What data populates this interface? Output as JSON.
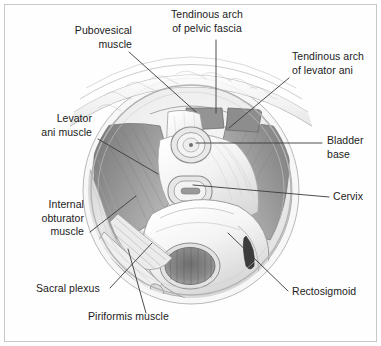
{
  "figure": {
    "type": "anatomical-illustration",
    "background_color": "#ffffff",
    "frame_color": "#c8c8c8",
    "label_color": "#1b1b1b",
    "leader_line_color": "#3a3a3a",
    "palette": {
      "muscle_dark": "#8c8c8c",
      "muscle_mid": "#aaaaaa",
      "muscle_light": "#cfcfcf",
      "organ_light": "#f1f1f1",
      "organ_shadow": "#d8d8d8",
      "outline": "#6e6e6e",
      "lumen_dark": "#5a5a5a"
    },
    "labels": [
      {
        "id": "pubovesical-muscle",
        "text": "Pubovesical\nmuscle",
        "align": "right",
        "x": 66,
        "y": 31,
        "leader": [
          [
            129,
            52
          ],
          [
            196,
            112
          ]
        ]
      },
      {
        "id": "tendinous-arch-of-pelvic-fascia",
        "text": "Tendinous arch\nof pelvic fascia",
        "align": "center",
        "x": 179,
        "y": 10,
        "leader": [
          [
            216,
            40
          ],
          [
            216,
            113
          ]
        ]
      },
      {
        "id": "tendinous-arch-of-levator-ani",
        "text": "Tendinous arch\nof levator ani",
        "align": "left",
        "x": 292,
        "y": 52,
        "leader": [
          [
            289,
            78
          ],
          [
            229,
            128
          ]
        ]
      },
      {
        "id": "levator-ani-muscle",
        "text": "Levator\nani muscle",
        "align": "right",
        "x": 22,
        "y": 118,
        "leader": [
          [
            98,
            139
          ],
          [
            158,
            174
          ]
        ]
      },
      {
        "id": "bladder-base",
        "text": "Bladder\nbase",
        "align": "left",
        "x": 327,
        "y": 136,
        "leader": [
          [
            322,
            143
          ],
          [
            196,
            143
          ]
        ]
      },
      {
        "id": "cervix",
        "text": "Cervix",
        "align": "left",
        "x": 333,
        "y": 192,
        "leader": [
          [
            329,
            197
          ],
          [
            193,
            185
          ]
        ]
      },
      {
        "id": "internal-obturator-muscle",
        "text": "Internal\nobturator\nmuscle",
        "align": "right",
        "x": 22,
        "y": 203,
        "leader": [
          [
            90,
            232
          ],
          [
            136,
            196
          ]
        ]
      },
      {
        "id": "sacral-plexus",
        "text": "Sacral plexus",
        "align": "left",
        "x": 36,
        "y": 288,
        "leader": [
          [
            110,
            288
          ],
          [
            152,
            243
          ]
        ]
      },
      {
        "id": "piriformis-muscle",
        "text": "Piriformis muscle",
        "align": "left",
        "x": 88,
        "y": 316,
        "leader": [
          [
            146,
            313
          ],
          [
            128,
            249
          ]
        ]
      },
      {
        "id": "rectosigmoid",
        "text": "Rectosigmoid",
        "align": "left",
        "x": 292,
        "y": 291,
        "leader": [
          [
            288,
            291
          ],
          [
            228,
            233
          ]
        ]
      }
    ]
  }
}
